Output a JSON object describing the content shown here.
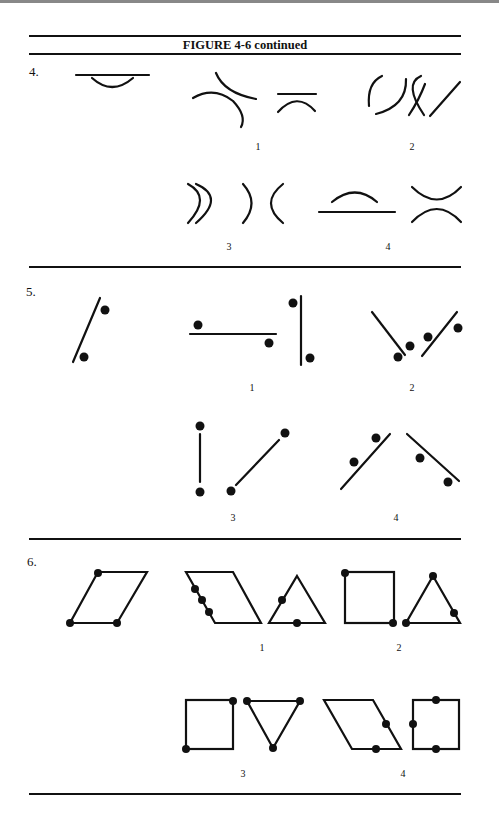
{
  "figure": {
    "title": "FIGURE 4-6 continued",
    "items": [
      {
        "number": "4.",
        "options": [
          "1",
          "2",
          "3",
          "4"
        ]
      },
      {
        "number": "5.",
        "options": [
          "1",
          "2",
          "3",
          "4"
        ]
      },
      {
        "number": "6.",
        "options": [
          "1",
          "2",
          "3",
          "4"
        ]
      }
    ]
  }
}
